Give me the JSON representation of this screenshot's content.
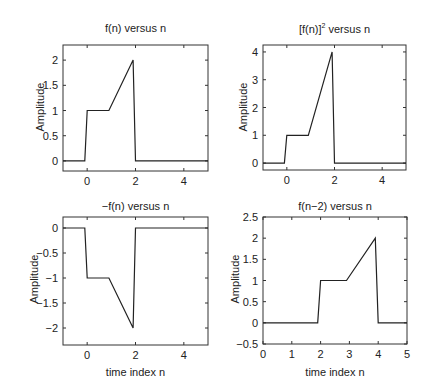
{
  "chart_data": [
    {
      "type": "line",
      "title": "f(n) versus n",
      "xlabel": "",
      "ylabel": "Amplitude",
      "xlim": [
        -1,
        5
      ],
      "ylim": [
        -0.2,
        2.3
      ],
      "xticks": [
        0,
        2,
        4
      ],
      "yticks": [
        0,
        0.5,
        1,
        1.5,
        2
      ],
      "ytick_labels": [
        "0",
        "0.5",
        "1",
        "1.5",
        "2"
      ],
      "x": [
        -1,
        -0.1,
        0,
        0.9,
        1.9,
        2,
        5
      ],
      "y": [
        0,
        0,
        1,
        1,
        2,
        0,
        0
      ],
      "grid": false
    },
    {
      "type": "line",
      "title": "[f(n)]^2 versus n",
      "title_base": "[f(n)]",
      "title_sup": "2",
      "title_rest": " versus n",
      "xlabel": "",
      "ylabel": "Amplitude",
      "xlim": [
        -1,
        5
      ],
      "ylim": [
        -0.25,
        4.25
      ],
      "xticks": [
        0,
        2,
        4
      ],
      "yticks": [
        0,
        1,
        2,
        3,
        4
      ],
      "ytick_labels": [
        "0",
        "1",
        "2",
        "3",
        "4"
      ],
      "x": [
        -1,
        -0.1,
        0,
        0.9,
        1.9,
        2,
        5
      ],
      "y": [
        0,
        0,
        1,
        1,
        4,
        0,
        0
      ],
      "grid": false
    },
    {
      "type": "line",
      "title": "−f(n) versus n",
      "xlabel": "time index n",
      "ylabel": "Amplitude",
      "xlim": [
        -1,
        5
      ],
      "ylim": [
        -2.34,
        0.22
      ],
      "xticks": [
        0,
        2,
        4
      ],
      "yticks": [
        0,
        -0.5,
        -1,
        -1.5,
        -2
      ],
      "ytick_labels": [
        "0",
        "−0.5",
        "−1",
        "−1.5",
        "−2"
      ],
      "x": [
        -1,
        -0.1,
        0,
        0.9,
        1.9,
        2,
        5
      ],
      "y": [
        0,
        0,
        -1,
        -1,
        -2,
        0,
        0
      ],
      "grid": false
    },
    {
      "type": "line",
      "title": "f(n−2) versus n",
      "xlabel": "time index n",
      "ylabel": "Amplitude",
      "xlim": [
        0,
        5
      ],
      "ylim": [
        -0.5,
        2.5
      ],
      "xticks": [
        0,
        1,
        2,
        3,
        4,
        5
      ],
      "yticks": [
        -0.5,
        0,
        0.5,
        1,
        1.5,
        2,
        2.5
      ],
      "ytick_labels": [
        "−0.5",
        "0",
        "0.5",
        "1",
        "1.5",
        "2",
        "2.5"
      ],
      "x": [
        0,
        1.9,
        2,
        2.9,
        3.9,
        4,
        5
      ],
      "y": [
        0,
        0,
        1,
        1,
        2,
        0,
        0
      ],
      "grid": false
    }
  ]
}
